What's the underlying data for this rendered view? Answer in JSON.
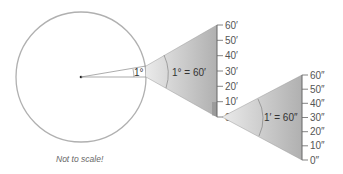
{
  "caption": "Not to scale!",
  "small_angle_label": "1°",
  "first_zoom": {
    "equation": "1° = 60′",
    "ticks": [
      "60′",
      "50′",
      "40′",
      "30′",
      "20′",
      "10′",
      "0′"
    ]
  },
  "second_zoom": {
    "equation": "1′ = 60″",
    "ticks": [
      "60″",
      "50″",
      "40″",
      "30″",
      "20″",
      "10″",
      "0″"
    ]
  },
  "colors": {
    "circle_stroke": "#a8a8a8",
    "wedge_light": "#e6e6e6",
    "wedge_dark": "#b5b5b5",
    "axis": "#666666"
  }
}
